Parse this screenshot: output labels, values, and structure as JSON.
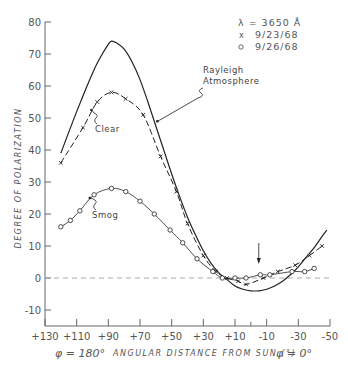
{
  "chart_data": {
    "type": "line",
    "title": "",
    "xlabel": "ANGULAR DISTANCE FROM SUN (°)",
    "xlabel_left": "φ = 180°",
    "xlabel_right": "φ = 0°",
    "ylabel": "DEGREE OF POLARIZATION",
    "xlim": [
      130,
      -50
    ],
    "ylim": [
      -15,
      80
    ],
    "x_ticks": [
      "+130",
      "+110",
      "+90",
      "+70",
      "+50",
      "+30",
      "+10",
      "-10",
      "-30",
      "-50"
    ],
    "x_tick_values": [
      130,
      110,
      90,
      70,
      50,
      30,
      10,
      -10,
      -30,
      -50
    ],
    "y_ticks": [
      "80",
      "70",
      "60",
      "50",
      "40",
      "30",
      "20",
      "10",
      "0",
      "-10"
    ],
    "y_tick_values": [
      80,
      70,
      60,
      50,
      40,
      30,
      20,
      10,
      0,
      -10
    ],
    "grid": false,
    "zero_line": "dashed",
    "legend": {
      "wavelength": "λ = 3650 Å",
      "entries": [
        {
          "marker": "x",
          "label": "9/23/68"
        },
        {
          "marker": "o",
          "label": "9/26/68"
        }
      ],
      "position": "top-right"
    },
    "annotations": [
      {
        "text": "Rayleigh",
        "line2": "Atmosphere",
        "target_series": "Rayleigh Atmosphere"
      },
      {
        "text": "Clear",
        "target_series": "Clear"
      },
      {
        "text": "Smog",
        "target_series": "Smog"
      },
      {
        "text": "↓",
        "note": "arrow marking sun position near -5°"
      }
    ],
    "series": [
      {
        "name": "Rayleigh Atmosphere",
        "style": "solid",
        "marker": "none",
        "x": [
          120,
          110,
          100,
          95,
          90,
          88,
          85,
          80,
          75,
          70,
          65,
          60,
          55,
          50,
          45,
          40,
          35,
          30,
          25,
          20,
          15,
          10,
          5,
          0,
          -5,
          -10,
          -15,
          -20,
          -25,
          -30,
          -35,
          -40,
          -45,
          -48
        ],
        "y": [
          39,
          52,
          64,
          69,
          73,
          74,
          73.5,
          71.5,
          67.5,
          62,
          55,
          47.5,
          40,
          32.5,
          25.5,
          19,
          13.5,
          8.5,
          4.5,
          1.5,
          -0.5,
          -2.5,
          -3.5,
          -4,
          -4,
          -3.5,
          -2.5,
          -1,
          1,
          3.5,
          6.5,
          9.5,
          13,
          15
        ]
      },
      {
        "name": "Clear",
        "style": "dashed",
        "marker": "x",
        "date": "9/23/68",
        "x": [
          120,
          106,
          97,
          88,
          79,
          68,
          57,
          47,
          40,
          30,
          22,
          15,
          8,
          3,
          -8,
          -17,
          -28,
          -37,
          -45
        ],
        "y": [
          36,
          47,
          55,
          58,
          56,
          51,
          38,
          27,
          17,
          7,
          2,
          0,
          -1,
          -2,
          0,
          2,
          4,
          7,
          10
        ]
      },
      {
        "name": "Smog",
        "style": "solid-thin",
        "marker": "o",
        "date": "9/26/68",
        "x": [
          120,
          114,
          108,
          99,
          88,
          79,
          70,
          61,
          51,
          43,
          34,
          24,
          18,
          10,
          3,
          -6,
          -12,
          -26,
          -34,
          -40
        ],
        "y": [
          16,
          18,
          21,
          26,
          28,
          27,
          24,
          20,
          15,
          11,
          6,
          2,
          0,
          0,
          0,
          1,
          1,
          2,
          2,
          3
        ]
      }
    ]
  },
  "colors": {
    "ink": "#222222",
    "axis": "#666666",
    "zero_line": "#aaaaaa"
  }
}
